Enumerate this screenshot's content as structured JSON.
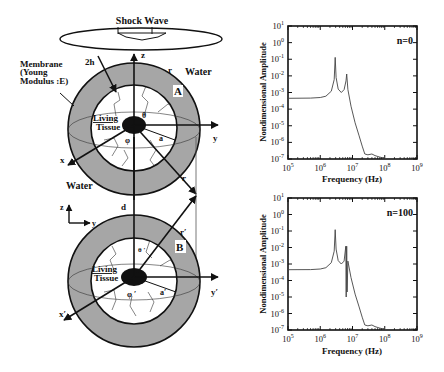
{
  "diagram": {
    "shock_wave_label": "Shock Wave",
    "membrane_label_line1": "Membrane",
    "membrane_label_line2": "(Young",
    "membrane_label_line3": "Modulus :E)",
    "water_label_top": "Water",
    "water_label_bottom": "Water",
    "thickness_label": "2h",
    "sphere_a": {
      "tag": "A",
      "tissue_line1": "Living",
      "tissue_line2": "Tissue",
      "theta": "θ",
      "phi": "φ",
      "radius": "a",
      "r_label": "r",
      "r_label2": "r",
      "axis_x": "x",
      "axis_y": "y",
      "axis_z": "z"
    },
    "distance_label": "d",
    "frame_axis_z": "z",
    "frame_axis_y": "y",
    "sphere_b": {
      "tag": "B",
      "tissue_line1": "Living",
      "tissue_line2": "Tissue",
      "theta": "θ ′",
      "phi": "φ ′",
      "radius": "a′",
      "r_label": "r′",
      "axis_x": "x′",
      "axis_y": "y′"
    },
    "colors": {
      "membrane": "#a6a6a6",
      "nucleus": "#111111",
      "line": "#111111"
    }
  },
  "chart_data": [
    {
      "type": "line",
      "title": "n=0",
      "xlabel": "Frequency (Hz)",
      "ylabel": "Nondimensional Amplitude",
      "xscale": "log",
      "yscale": "log",
      "xlim": [
        100000,
        1000000000
      ],
      "ylim": [
        1e-07,
        10
      ],
      "xticks": [
        "10^5",
        "10^6",
        "10^7",
        "10^8",
        "10^9"
      ],
      "yticks": [
        "10^1",
        "10^0",
        "10^-1",
        "10^-2",
        "10^-3",
        "10^-4",
        "10^-5",
        "10^-6",
        "10^-7"
      ],
      "grid": false,
      "x": [
        100000.0,
        500000.0,
        1000000.0,
        1500000.0,
        2200000.0,
        2700000.0,
        2900000.0,
        3100000.0,
        3600000.0,
        4500000.0,
        5500000.0,
        6300000.0,
        6600000.0,
        7200000.0,
        9000000.0,
        12000000.0,
        16000000.0,
        20000000.0,
        24000000.0,
        30000000.0,
        40000000.0,
        50000000.0,
        70000000.0,
        100000000.0,
        115000000.0
      ],
      "y": [
        0.00045,
        0.00046,
        0.0005,
        0.0006,
        0.0012,
        0.006,
        0.13,
        0.008,
        0.0016,
        0.001,
        0.0015,
        0.005,
        0.013,
        0.0015,
        0.00015,
        1.5e-05,
        2.5e-06,
        6e-07,
        2e-07,
        1.8e-07,
        2e-07,
        1.6e-07,
        1.3e-07,
        1.1e-07,
        1e-07
      ]
    },
    {
      "type": "line",
      "title": "n=100",
      "xlabel": "Frequency (Hz)",
      "ylabel": "Nondimensional Amplitude",
      "xscale": "log",
      "yscale": "log",
      "xlim": [
        100000,
        1000000000
      ],
      "ylim": [
        1e-07,
        10
      ],
      "xticks": [
        "10^5",
        "10^6",
        "10^7",
        "10^8",
        "10^9"
      ],
      "yticks": [
        "10^1",
        "10^0",
        "10^-1",
        "10^-2",
        "10^-3",
        "10^-4",
        "10^-5",
        "10^-6",
        "10^-7"
      ],
      "grid": false,
      "x": [
        100000.0,
        500000.0,
        1000000.0,
        1500000.0,
        2200000.0,
        2700000.0,
        2900000.0,
        3100000.0,
        3600000.0,
        4500000.0,
        5500000.0,
        6200000.0,
        6400000.0,
        6600000.0,
        6800000.0,
        7200000.0,
        9000000.0,
        12000000.0,
        16000000.0,
        20000000.0,
        24000000.0,
        30000000.0,
        40000000.0,
        50000000.0,
        70000000.0,
        100000000.0,
        115000000.0
      ],
      "y": [
        0.00045,
        0.00046,
        0.0005,
        0.0006,
        0.0012,
        0.006,
        0.12,
        0.008,
        0.0016,
        0.001,
        0.0015,
        0.012,
        1e-05,
        0.012,
        2e-05,
        0.0015,
        0.00015,
        1.5e-05,
        2.5e-06,
        6e-07,
        2e-07,
        1.8e-07,
        2e-07,
        1.6e-07,
        1.3e-07,
        1.1e-07,
        1e-07
      ]
    }
  ]
}
